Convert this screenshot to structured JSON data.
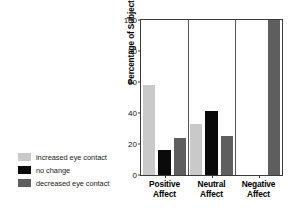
{
  "chart_data": {
    "type": "bar",
    "title": "",
    "xlabel": "",
    "ylabel": "Percentage of Subjects",
    "categories": [
      "Positive Affect",
      "Neutral Affect",
      "Negative Affect"
    ],
    "category_lines": [
      [
        "Positive",
        "Affect"
      ],
      [
        "Neutral",
        "Affect"
      ],
      [
        "Negative",
        "Affect"
      ]
    ],
    "series": [
      {
        "name": "increased eye contact",
        "color": "#c9c9c9",
        "values": [
          58,
          33,
          0
        ]
      },
      {
        "name": "no change",
        "color": "#0a0a0a",
        "values": [
          16,
          41,
          0
        ]
      },
      {
        "name": "decreased eye contact",
        "color": "#5e5e5e",
        "values": [
          24,
          25,
          100
        ]
      }
    ],
    "ylim": [
      0,
      100
    ],
    "yticks": [
      0,
      20,
      40,
      60,
      80,
      100
    ],
    "ytick_labels": [
      "0",
      "20",
      "40",
      "60",
      "80",
      "100"
    ],
    "grid": false,
    "legend_position": "outside-left-bottom",
    "group_separators": true
  },
  "legend": {
    "items": [
      {
        "label": "increased eye contact",
        "color": "#c9c9c9"
      },
      {
        "label": "no change",
        "color": "#0a0a0a"
      },
      {
        "label": "decreased eye contact",
        "color": "#5e5e5e"
      }
    ]
  }
}
